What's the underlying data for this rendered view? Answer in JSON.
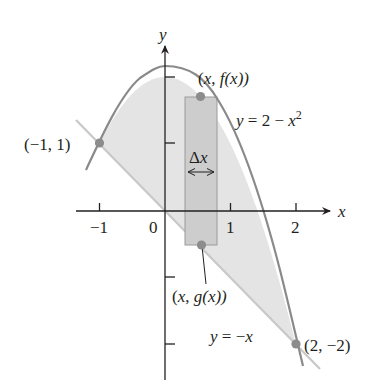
{
  "figure": {
    "axes": {
      "x_label": "x",
      "y_label": "y",
      "x_ticks": [
        {
          "value": -1,
          "label": "−1"
        },
        {
          "value": 0,
          "label": "0"
        },
        {
          "value": 1,
          "label": "1"
        },
        {
          "value": 2,
          "label": "2"
        }
      ],
      "y_ticks": [
        2,
        1,
        -1,
        -2
      ]
    },
    "curves": [
      {
        "name": "parabola",
        "label_prefix": "y = 2 − ",
        "label_var": "x",
        "label_sup": "2",
        "equation": "y = 2 - x^2"
      },
      {
        "name": "line",
        "label_prefix": "y = −",
        "label_var": "x",
        "equation": "y = -x"
      }
    ],
    "points": [
      {
        "name": "left-intersection",
        "label": "(−1, 1)",
        "x": -1,
        "y": 1
      },
      {
        "name": "right-intersection",
        "label": "(2, −2)",
        "x": 2,
        "y": -2
      },
      {
        "name": "upper-point",
        "label_open": "(",
        "label_var": "x",
        "label_mid": ", ",
        "label_fn": "f",
        "label_arg": "(x))",
        "text": "(x, f(x))"
      },
      {
        "name": "lower-point",
        "label_open": "(",
        "label_var": "x",
        "label_mid": ", ",
        "label_fn": "g",
        "label_arg": "(x))",
        "text": "(x, g(x))"
      }
    ],
    "strip": {
      "delta_symbol": "Δ",
      "delta_var": "x",
      "label": "Δx"
    },
    "colors": {
      "curve": "#8a8a8a",
      "region_fill": "#e3e3e3",
      "strip_fill": "#cfcfcf",
      "strip_stroke": "#9a9a9a",
      "point": "#8c8c8c",
      "axis": "#231f20"
    }
  }
}
